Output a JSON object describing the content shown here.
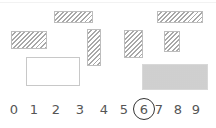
{
  "shapes": [
    {
      "id": "hatched-top-left",
      "pattern": "hatched",
      "x": 54,
      "y": 11,
      "w": 39,
      "h": 12
    },
    {
      "id": "hatched-left",
      "pattern": "hatched",
      "x": 11,
      "y": 31,
      "w": 36,
      "h": 18
    },
    {
      "id": "hatched-tall",
      "pattern": "hatched",
      "x": 87,
      "y": 29,
      "w": 14,
      "h": 37
    },
    {
      "id": "empty-rect",
      "pattern": "empty",
      "x": 26,
      "y": 57,
      "w": 54,
      "h": 29
    },
    {
      "id": "hatched-mid",
      "pattern": "hatched",
      "x": 124,
      "y": 30,
      "w": 19,
      "h": 28
    },
    {
      "id": "hatched-small",
      "pattern": "hatched",
      "x": 164,
      "y": 31,
      "w": 16,
      "h": 21
    },
    {
      "id": "hatched-top-right",
      "pattern": "hatched",
      "x": 157,
      "y": 11,
      "w": 46,
      "h": 12
    },
    {
      "id": "dotted-rect",
      "pattern": "dotted",
      "x": 142,
      "y": 64,
      "w": 66,
      "h": 26
    }
  ],
  "number_line": {
    "digits": [
      "0",
      "1",
      "2",
      "3",
      "4",
      "5",
      "6",
      "7",
      "8",
      "9"
    ],
    "selected": "6"
  },
  "colors": {
    "hatch": "#a8a8a8",
    "circle": "#333333",
    "digit": "#555555"
  }
}
